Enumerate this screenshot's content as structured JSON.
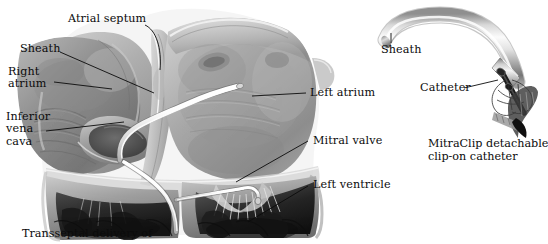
{
  "figure": {
    "title_caption": "Transseptal delivery of",
    "background_color": "#ffffff",
    "ink_color": "#0b0b0b",
    "style": "grayscale medical illustration"
  },
  "left_panel": {
    "name": "transseptal-heart-cutaway",
    "labels": [
      {
        "id": "atrial-septum",
        "text": "Atrial septum",
        "x": 68,
        "y": 18
      },
      {
        "id": "sheath-heart",
        "text": "Sheath",
        "x": 20,
        "y": 48
      },
      {
        "id": "right-atrium",
        "text": "Right\natrium",
        "x": 8,
        "y": 68
      },
      {
        "id": "inferior-vena-cava",
        "text": "Inferior\nvena\ncava",
        "x": 6,
        "y": 113
      },
      {
        "id": "left-atrium",
        "text": "Left atrium",
        "x": 310,
        "y": 88
      },
      {
        "id": "mitral-valve",
        "text": "Mitral valve",
        "x": 313,
        "y": 136
      },
      {
        "id": "left-ventricle",
        "text": "Left ventricle",
        "x": 313,
        "y": 180
      }
    ],
    "anatomy_parts": [
      "right atrium",
      "left atrium",
      "atrial septum",
      "mitral valve",
      "left ventricle",
      "inferior vena cava",
      "chordae tendineae",
      "papillary muscles"
    ],
    "device_in_heart": "sheath and catheter crossing the atrial septum into the left atrium"
  },
  "right_panel": {
    "name": "mitraclip-device-detail",
    "caption": "MitraClip detachable\nclip-on catheter",
    "caption_x": 428,
    "caption_y": 139,
    "labels": [
      {
        "id": "sheath-device",
        "text": "Sheath",
        "x": 389,
        "y": 44
      },
      {
        "id": "catheter",
        "text": "Catheter",
        "x": 422,
        "y": 83
      }
    ],
    "parts": [
      "curved metallic sheath",
      "catheter shaft",
      "detachable clip with grippers"
    ]
  }
}
